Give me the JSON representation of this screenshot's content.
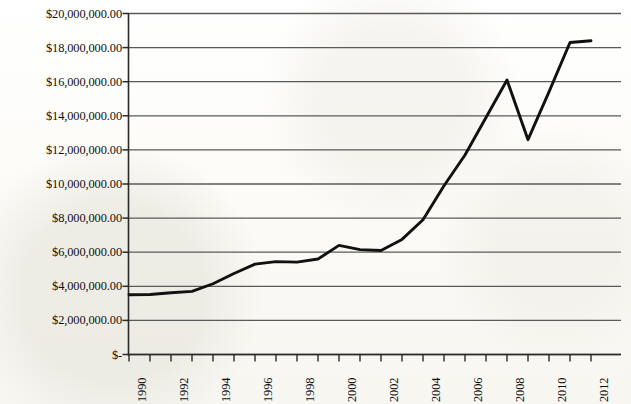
{
  "chart_data": {
    "type": "line",
    "title": "",
    "subtitle": "",
    "xlabel": "",
    "ylabel": "",
    "grid": true,
    "legend": false,
    "legend_position": "none",
    "line_color": "#111111",
    "gridline_color": "#5a5a5a",
    "axis_color": "#2a2a2a",
    "xlim": [
      1990,
      2012
    ],
    "ylim": [
      0,
      20000000
    ],
    "x": [
      1990,
      1991,
      1992,
      1993,
      1994,
      1995,
      1996,
      1997,
      1998,
      1999,
      2000,
      2001,
      2002,
      2003,
      2004,
      2005,
      2006,
      2007,
      2008,
      2009,
      2010,
      2011,
      2012
    ],
    "values": [
      3500000,
      3520000,
      3620000,
      3700000,
      4150000,
      4750000,
      5300000,
      5450000,
      5420000,
      5600000,
      6400000,
      6150000,
      6100000,
      6750000,
      7900000,
      9900000,
      11700000,
      13900000,
      16100000,
      12600000,
      15400000,
      18300000,
      18400000
    ],
    "series": [
      {
        "name": "",
        "values": [
          3500000,
          3520000,
          3620000,
          3700000,
          4150000,
          4750000,
          5300000,
          5450000,
          5420000,
          5600000,
          6400000,
          6150000,
          6100000,
          6750000,
          7900000,
          9900000,
          11700000,
          13900000,
          16100000,
          12600000,
          15400000,
          18300000,
          18400000
        ]
      }
    ],
    "y_ticks": [
      0,
      2000000,
      4000000,
      6000000,
      8000000,
      10000000,
      12000000,
      14000000,
      16000000,
      18000000,
      20000000
    ],
    "y_tick_labels": [
      "$-",
      "$2,000,000.00",
      "$4,000,000.00",
      "$6,000,000.00",
      "$8,000,000.00",
      "$10,000,000.00",
      "$12,000,000.00",
      "$14,000,000.00",
      "$16,000,000.00",
      "$18,000,000.00",
      "$20,000,000.00"
    ],
    "x_ticks": [
      1990,
      1991,
      1992,
      1993,
      1994,
      1995,
      1996,
      1997,
      1998,
      1999,
      2000,
      2001,
      2002,
      2003,
      2004,
      2005,
      2006,
      2007,
      2008,
      2009,
      2010,
      2011,
      2012
    ],
    "x_tick_labels": [
      "1990",
      "",
      "1992",
      "",
      "1994",
      "",
      "1996",
      "",
      "1998",
      "",
      "2000",
      "",
      "2002",
      "",
      "2004",
      "",
      "2006",
      "",
      "2008",
      "",
      "2010",
      "",
      "2012"
    ],
    "annotations": []
  }
}
